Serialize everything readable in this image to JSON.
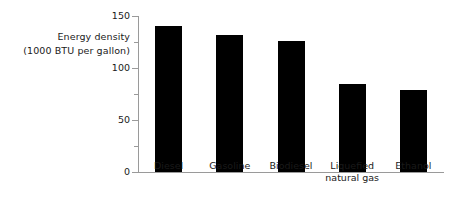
{
  "chart_data": {
    "type": "bar",
    "title": "",
    "xlabel": "",
    "ylabel": "Energy density (1000 BTU per gallon)",
    "ylabel_line1": "Energy density",
    "ylabel_line2": "(1000 BTU per gallon)",
    "categories": [
      "Diesel",
      "Gasoline",
      "Biodiesel",
      "Liquefied\nnatural gas",
      "Ethanol"
    ],
    "values": [
      140,
      132,
      126,
      85,
      79
    ],
    "ylim": [
      0,
      150
    ],
    "ytick_labels": [
      "0",
      "50",
      "100",
      "150"
    ],
    "ytick_values": [
      0,
      50,
      100,
      150
    ],
    "yminor_tick_values": [
      25,
      75,
      125
    ],
    "grid": false,
    "legend": "none",
    "bar_color": "#000000",
    "axis_color": "#9a9a9a",
    "text_color": "#1a1a1a",
    "background_color": "#ffffff"
  }
}
